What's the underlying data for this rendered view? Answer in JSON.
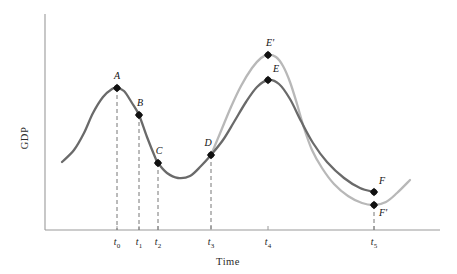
{
  "chart_data": {
    "type": "line",
    "title": "",
    "subtitle": "",
    "xlabel": "Time",
    "ylabel": "GDP",
    "grid": false,
    "legend_position": "none",
    "xlim": [
      0,
      1
    ],
    "ylim": [
      0,
      1
    ],
    "x_tick_labels": [
      "t0",
      "t1",
      "t2",
      "t3",
      "t4",
      "t5"
    ],
    "x_tick_bases": [
      "t",
      "t",
      "t",
      "t",
      "t",
      "t"
    ],
    "x_tick_subscripts": [
      "0",
      "1",
      "2",
      "3",
      "4",
      "5"
    ],
    "x_tick_px": [
      117,
      139,
      158,
      211,
      268,
      374
    ],
    "series": [
      {
        "name": "Actual GDP",
        "color": "#6a6a6a",
        "style": "solid",
        "points_px": [
          [
            62,
            162
          ],
          [
            74,
            150
          ],
          [
            84,
            133
          ],
          [
            93,
            113
          ],
          [
            103,
            97
          ],
          [
            112,
            89
          ],
          [
            117,
            88
          ],
          [
            124,
            91
          ],
          [
            132,
            103
          ],
          [
            139,
            115
          ],
          [
            147,
            137
          ],
          [
            155,
            157
          ],
          [
            158,
            163
          ],
          [
            167,
            173
          ],
          [
            178,
            178
          ],
          [
            190,
            176
          ],
          [
            201,
            166
          ],
          [
            211,
            155
          ],
          [
            223,
            140
          ],
          [
            234,
            122
          ],
          [
            246,
            102
          ],
          [
            257,
            87
          ],
          [
            268,
            80
          ],
          [
            279,
            84
          ],
          [
            290,
            99
          ],
          [
            301,
            121
          ],
          [
            313,
            143
          ],
          [
            327,
            162
          ],
          [
            344,
            178
          ],
          [
            360,
            188
          ],
          [
            374,
            192
          ]
        ]
      },
      {
        "name": "Counterfactual GDP",
        "color": "#b8b8b8",
        "style": "solid",
        "points_px": [
          [
            211,
            155
          ],
          [
            221,
            131
          ],
          [
            231,
            107
          ],
          [
            241,
            86
          ],
          [
            252,
            68
          ],
          [
            261,
            58
          ],
          [
            268,
            55
          ],
          [
            276,
            57
          ],
          [
            283,
            66
          ],
          [
            290,
            82
          ],
          [
            297,
            104
          ],
          [
            304,
            128
          ],
          [
            312,
            150
          ],
          [
            322,
            168
          ],
          [
            334,
            184
          ],
          [
            348,
            196
          ],
          [
            362,
            203
          ],
          [
            374,
            205
          ],
          [
            386,
            202
          ],
          [
            397,
            193
          ],
          [
            410,
            180
          ]
        ]
      }
    ],
    "annotated_points": [
      {
        "label": "A",
        "x_px": 117,
        "y_px": 88,
        "label_dx": 0,
        "label_dy": -9,
        "series": "Actual GDP",
        "dropline": true
      },
      {
        "label": "B",
        "x_px": 139,
        "y_px": 115,
        "label_dx": 1,
        "label_dy": -9,
        "series": "Actual GDP",
        "dropline": true
      },
      {
        "label": "C",
        "x_px": 158,
        "y_px": 163,
        "label_dx": 1,
        "label_dy": -9,
        "series": "Actual GDP",
        "dropline": true
      },
      {
        "label": "D",
        "x_px": 211,
        "y_px": 155,
        "label_dx": -3,
        "label_dy": -9,
        "series": "Actual GDP",
        "dropline": true
      },
      {
        "label": "E",
        "x_px": 268,
        "y_px": 80,
        "label_dx": 8,
        "label_dy": -8,
        "series": "Actual GDP",
        "dropline": false
      },
      {
        "label": "E'",
        "x_px": 268,
        "y_px": 55,
        "label_dx": 2,
        "label_dy": -9,
        "series": "Counterfactual GDP",
        "dropline": false
      },
      {
        "label": "F",
        "x_px": 374,
        "y_px": 192,
        "label_dx": 8,
        "label_dy": -8,
        "series": "Actual GDP",
        "dropline": false
      },
      {
        "label": "F'",
        "x_px": 374,
        "y_px": 205,
        "label_dx": 9,
        "label_dy": 11,
        "series": "Counterfactual GDP",
        "dropline": true
      }
    ],
    "dropline_baseline_px": 230,
    "axis": {
      "origin_px": [
        45,
        230
      ],
      "y_top_px": 14,
      "x_right_px": 440,
      "color": "#9a9a9a"
    },
    "colors": {
      "primary_curve": "#6a6a6a",
      "secondary_curve": "#b8b8b8",
      "axis": "#9a9a9a",
      "dropline": "#777777",
      "marker": "#111111",
      "text": "#1a1a1a",
      "background": "#ffffff"
    }
  },
  "labels": {
    "ylabel": "GDP",
    "xlabel": "Time"
  }
}
